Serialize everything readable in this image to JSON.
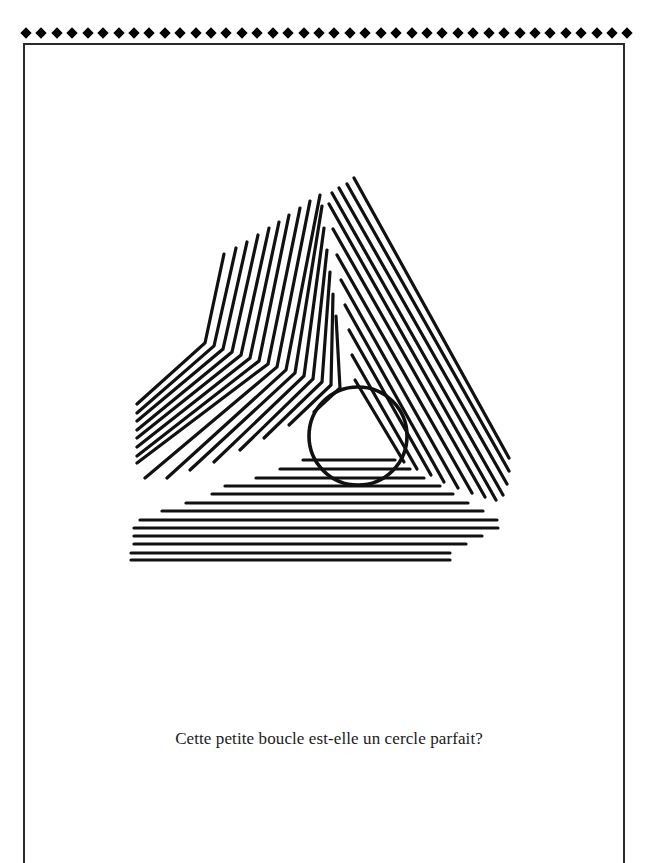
{
  "page": {
    "caption": "Cette petite boucle est-elle un cercle parfait?",
    "border_diamond_count": 40,
    "line_color": "#111111",
    "frame_color": "#2a2a2a"
  },
  "figure": {
    "stroke_width": 3.2,
    "circle": {
      "cx": 358,
      "cy": 436,
      "r": 49,
      "stroke_width": 3.6
    },
    "left_band": [
      [
        [
          224,
          254
        ],
        [
          205,
          343
        ],
        [
          137,
          404
        ]
      ],
      [
        [
          236,
          248
        ],
        [
          214,
          346
        ],
        [
          137,
          413
        ]
      ],
      [
        [
          247,
          242
        ],
        [
          223,
          349
        ],
        [
          137,
          421
        ]
      ],
      [
        [
          258,
          235
        ],
        [
          232,
          352
        ],
        [
          137,
          430
        ]
      ],
      [
        [
          269,
          228
        ],
        [
          241,
          355
        ],
        [
          137,
          438
        ]
      ],
      [
        [
          279,
          222
        ],
        [
          250,
          358
        ],
        [
          137,
          447
        ]
      ],
      [
        [
          289,
          215
        ],
        [
          259,
          361
        ],
        [
          137,
          456
        ]
      ],
      [
        [
          300,
          208
        ],
        [
          268,
          364
        ],
        [
          137,
          463
        ]
      ],
      [
        [
          310,
          201
        ],
        [
          277,
          367
        ],
        [
          145,
          478
        ]
      ],
      [
        [
          320,
          195
        ],
        [
          286,
          370
        ],
        [
          167,
          478
        ]
      ],
      [
        [
          322,
          206
        ],
        [
          295,
          373
        ],
        [
          190,
          470
        ]
      ],
      [
        [
          324,
          228
        ],
        [
          304,
          376
        ],
        [
          214,
          462
        ]
      ],
      [
        [
          327,
          250
        ],
        [
          313,
          379
        ],
        [
          240,
          450
        ]
      ],
      [
        [
          330,
          272
        ],
        [
          322,
          382
        ],
        [
          264,
          438
        ]
      ],
      [
        [
          333,
          294
        ],
        [
          331,
          385
        ],
        [
          289,
          425
        ]
      ],
      [
        [
          336,
          316
        ],
        [
          340,
          388
        ],
        [
          314,
          412
        ]
      ]
    ],
    "right_band": [
      [
        [
          354,
          178
        ],
        [
          509,
          458
        ]
      ],
      [
        [
          347,
          184
        ],
        [
          509,
          471
        ]
      ],
      [
        [
          339,
          188
        ],
        [
          507,
          484
        ]
      ],
      [
        [
          332,
          193
        ],
        [
          503,
          495
        ]
      ],
      [
        [
          329,
          204
        ],
        [
          496,
          500
        ]
      ],
      [
        [
          333,
          229
        ],
        [
          485,
          497
        ]
      ],
      [
        [
          337,
          255
        ],
        [
          472,
          493
        ]
      ],
      [
        [
          341,
          280
        ],
        [
          458,
          488
        ]
      ],
      [
        [
          345,
          305
        ],
        [
          444,
          482
        ]
      ],
      [
        [
          349,
          330
        ],
        [
          431,
          475
        ]
      ],
      [
        [
          352,
          355
        ],
        [
          417,
          469
        ]
      ],
      [
        [
          355,
          380
        ],
        [
          404,
          462
        ]
      ]
    ],
    "bottom_band": [
      [
        303,
        460,
        395
      ],
      [
        280,
        469,
        410
      ],
      [
        256,
        478,
        424
      ],
      [
        225,
        486,
        440
      ],
      [
        212,
        494,
        453
      ],
      [
        186,
        503,
        468
      ],
      [
        162,
        511,
        483
      ],
      [
        140,
        520,
        497
      ],
      [
        134,
        528,
        498
      ],
      [
        134,
        536,
        482
      ],
      [
        134,
        544,
        466
      ],
      [
        131,
        553,
        450
      ],
      [
        131,
        560,
        450
      ]
    ]
  }
}
